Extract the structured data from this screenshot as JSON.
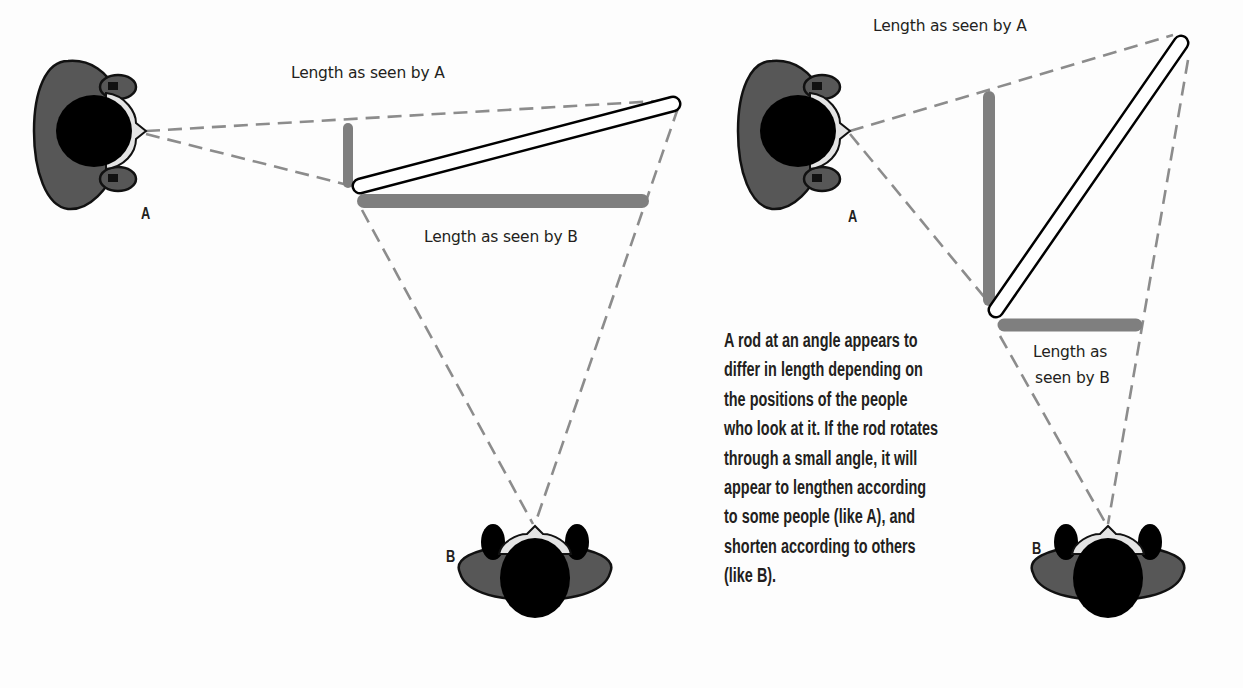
{
  "figures": [
    {
      "id": "left",
      "label_a": "Length as seen by A",
      "label_b": "Length as seen by B",
      "person_a": "A",
      "person_b": "B"
    },
    {
      "id": "right",
      "label_a": "Length as seen by A",
      "label_b_line1": "Length as",
      "label_b_line2": "seen by B",
      "person_a": "A",
      "person_b": "B"
    }
  ],
  "caption": {
    "lines": [
      "A rod at an angle appears to",
      "differ in length depending on",
      "the positions of the people",
      "who look at it. If the rod rotates",
      "through a small angle, it will",
      "appear to lengthen according",
      "to some people (like A), and",
      "shorten according to others",
      "(like B)."
    ]
  },
  "colors": {
    "projection_bar": "#808080",
    "dash_line": "#8c8c8c",
    "body": "#555555",
    "head": "#000000",
    "face": "#e6e6e6",
    "text": "#231f20"
  }
}
